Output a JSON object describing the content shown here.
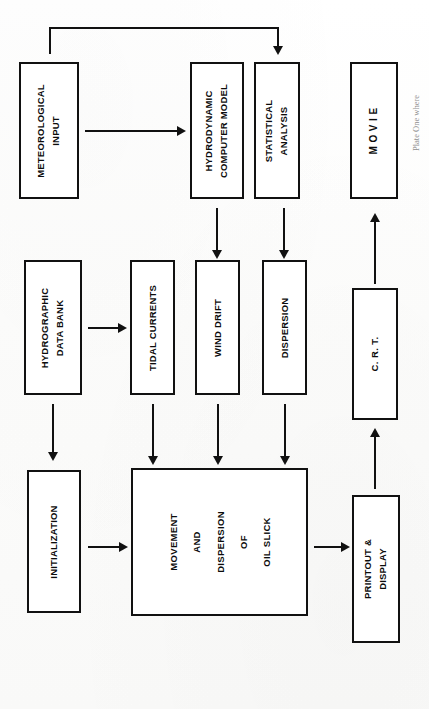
{
  "figure": {
    "orientation": "rotated-90-ccw",
    "ink_color": "#111111",
    "paper_color": "#ffffff",
    "edge_caption": "Plate  One  where"
  },
  "nodes": {
    "meteorological_input": {
      "lines": [
        "METEOROLOGICAL",
        "INPUT"
      ]
    },
    "hydrodynamic_model": {
      "lines": [
        "HYDRODYNAMIC",
        "COMPUTER  MODEL"
      ]
    },
    "statistical_analysis": {
      "lines": [
        "STATISTICAL",
        "ANALYSIS"
      ]
    },
    "movie": {
      "lines": [
        "M O V I E"
      ]
    },
    "hydrographic_data_bank": {
      "lines": [
        "HYDROGRAPHIC",
        "DATA      BANK"
      ]
    },
    "tidal_currents": {
      "lines": [
        "TIDAL  CURRENTS"
      ]
    },
    "wind_drift": {
      "lines": [
        "WIND  DRIFT"
      ]
    },
    "dispersion": {
      "lines": [
        "DISPERSION"
      ]
    },
    "crt": {
      "lines": [
        "C. R. T."
      ]
    },
    "initialization": {
      "lines": [
        "INITIALIZATION"
      ]
    },
    "movement_dispersion_oil_slick": {
      "lines": [
        "MOVEMENT",
        "AND",
        "DISPERSION",
        "OF",
        "OIL  SLICK"
      ]
    },
    "printout_display": {
      "lines": [
        "PRINTOUT  &",
        "DISPLAY"
      ]
    }
  },
  "edges": [
    {
      "from": "meteorological_input",
      "to": "hydrodynamic_model",
      "kind": "straight"
    },
    {
      "from": "meteorological_input",
      "to": "statistical_analysis",
      "kind": "feedback-elbow"
    },
    {
      "from": "hydrodynamic_model",
      "to": "wind_drift",
      "kind": "straight"
    },
    {
      "from": "statistical_analysis",
      "to": "dispersion",
      "kind": "straight"
    },
    {
      "from": "hydrographic_data_bank",
      "to": "tidal_currents",
      "kind": "straight"
    },
    {
      "from": "hydrographic_data_bank",
      "to": "initialization",
      "kind": "straight"
    },
    {
      "from": "tidal_currents",
      "to": "movement_dispersion_oil_slick",
      "kind": "straight"
    },
    {
      "from": "wind_drift",
      "to": "movement_dispersion_oil_slick",
      "kind": "straight"
    },
    {
      "from": "dispersion",
      "to": "movement_dispersion_oil_slick",
      "kind": "straight"
    },
    {
      "from": "initialization",
      "to": "movement_dispersion_oil_slick",
      "kind": "straight"
    },
    {
      "from": "movement_dispersion_oil_slick",
      "to": "printout_display",
      "kind": "straight"
    },
    {
      "from": "printout_display",
      "to": "crt",
      "kind": "straight"
    },
    {
      "from": "crt",
      "to": "movie",
      "kind": "straight"
    }
  ]
}
